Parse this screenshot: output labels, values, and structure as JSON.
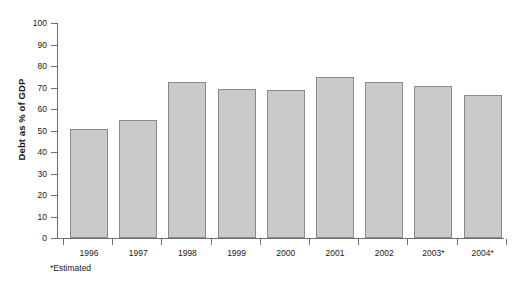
{
  "chart_data": {
    "type": "bar",
    "title": "",
    "xlabel": "",
    "ylabel": "Debt as % of GDP",
    "categories": [
      "1996",
      "1997",
      "1998",
      "1999",
      "2000",
      "2001",
      "2002",
      "2003*",
      "2004*"
    ],
    "values": [
      50.5,
      55,
      72.5,
      69.5,
      69,
      75,
      72.5,
      70.5,
      66.5
    ],
    "ylim": [
      0,
      100
    ],
    "ytick_labels": [
      "100",
      "90",
      "80",
      "70",
      "60",
      "50",
      "40",
      "30",
      "20",
      "10",
      "0"
    ],
    "ytick_values": [
      100,
      90,
      80,
      70,
      60,
      50,
      40,
      30,
      20,
      10,
      0
    ],
    "grid": false,
    "legend": null,
    "annotations": [
      "*Estimated"
    ],
    "bar_color": "#cacaca",
    "bar_border_color": "#8a8a8a",
    "axis_color": "#6e6e6e",
    "background": "#ffffff"
  },
  "footnote": "*Estimated"
}
